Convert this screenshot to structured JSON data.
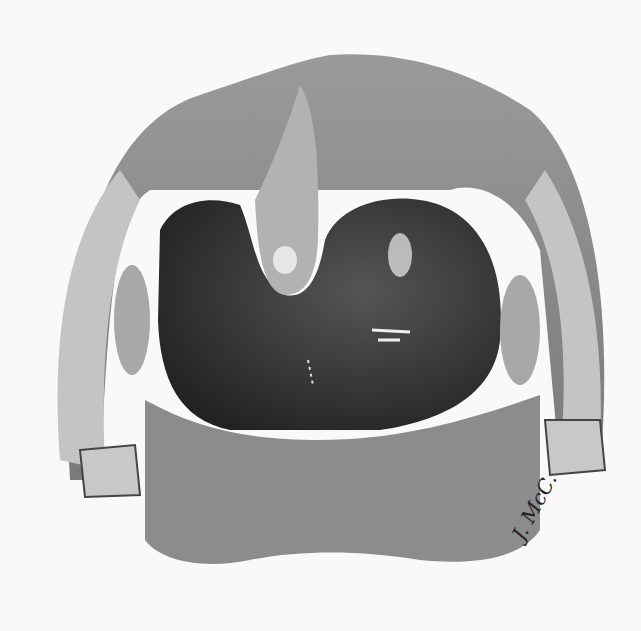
{
  "illustration": {
    "subject": "open mouth showing throat with enlarged swelling behind uvula",
    "style": "grayscale pencil drawing",
    "colors": {
      "background": "#f9f9f9",
      "tissue_light": "#bdbdbd",
      "tissue_mid": "#8a8a8a",
      "cavity_dark": "#2f2f2f",
      "highlight": "#e8e8e8"
    }
  },
  "signature": {
    "text": "J. McC."
  }
}
